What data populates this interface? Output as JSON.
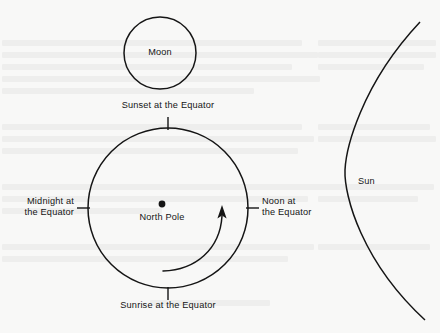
{
  "figure": {
    "type": "astronomy-diagram",
    "background_color": "#f8f8f7",
    "stroke_color": "#151515"
  },
  "bodies": {
    "moon": {
      "label": "Moon",
      "shape": "circle",
      "cx": 160,
      "cy": 53,
      "r": 36
    },
    "earth": {
      "label": "North Pole",
      "shape": "circle",
      "cx": 168,
      "cy": 208,
      "r": 80,
      "pole_marker": "filled-dot",
      "pole_dot_cx": 162,
      "pole_dot_cy": 204,
      "pole_dot_r": 3.4
    },
    "sun": {
      "label": "Sun",
      "shape": "arc",
      "label_x": 358,
      "label_y": 176
    }
  },
  "rotation": {
    "name": "earth-rotation-arrow",
    "direction": "counterclockwise",
    "arrowhead": "up"
  },
  "equator_markers": [
    {
      "name": "sunset",
      "label": "Sunset at the Equator",
      "position": "top",
      "x": 168,
      "y": 101,
      "align": "center"
    },
    {
      "name": "midnight",
      "label": "Midnight at\nthe Equator",
      "position": "left",
      "x": 76,
      "y": 197,
      "align": "right"
    },
    {
      "name": "noon",
      "label": "Noon at\nthe Equator",
      "position": "right",
      "x": 262,
      "y": 197,
      "align": "left"
    },
    {
      "name": "sunrise",
      "label": "Sunrise at the Equator",
      "position": "bottom",
      "x": 168,
      "y": 305,
      "align": "center"
    }
  ]
}
